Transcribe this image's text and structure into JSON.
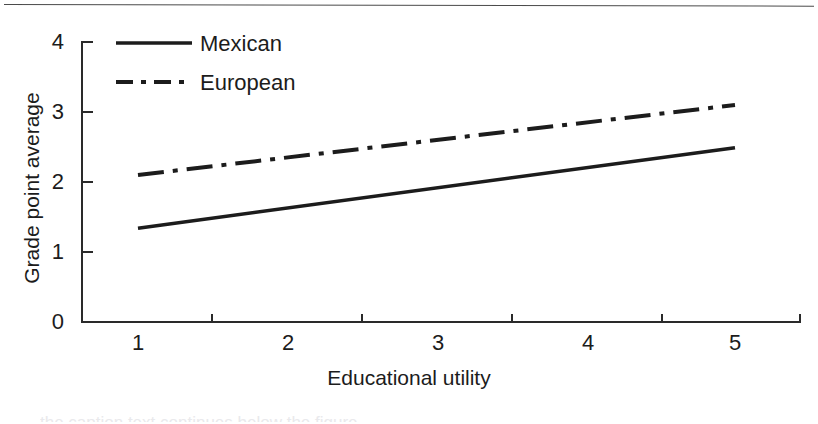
{
  "figure": {
    "background_color": "#ffffff",
    "ink_color": "#1c1c1c",
    "divider_color": "#3c3c3c"
  },
  "chart_data": {
    "type": "line",
    "title": "",
    "xlabel": "Educational utility",
    "ylabel": "Grade point average",
    "x": [
      1,
      2,
      3,
      4,
      5
    ],
    "xlim": [
      0.6,
      5.4
    ],
    "ylim": [
      0,
      4
    ],
    "xticks": [
      "1",
      "2",
      "3",
      "4",
      "5"
    ],
    "yticks": [
      "0",
      "1",
      "2",
      "3",
      "4"
    ],
    "grid": false,
    "legend_position": "top-left",
    "series": [
      {
        "name": "Mexican",
        "style": "solid",
        "color": "#1c1c1c",
        "values": [
          1.34,
          1.63,
          1.92,
          2.21,
          2.49
        ]
      },
      {
        "name": "European",
        "style": "dash-dot",
        "color": "#1c1c1c",
        "values": [
          2.1,
          2.35,
          2.6,
          2.85,
          3.1
        ]
      }
    ]
  },
  "axes": {
    "y_tick_labels": [
      "4",
      "3",
      "2",
      "1",
      "0"
    ],
    "x_tick_labels": [
      "1",
      "2",
      "3",
      "4",
      "5"
    ],
    "y_title": "Grade point average",
    "x_title": "Educational utility"
  },
  "legend": {
    "items": [
      {
        "label": "Mexican",
        "style": "solid"
      },
      {
        "label": "European",
        "style": "dash-dot"
      }
    ]
  },
  "page": {
    "bottom_cut_text": "the caption text continues below the figure"
  }
}
